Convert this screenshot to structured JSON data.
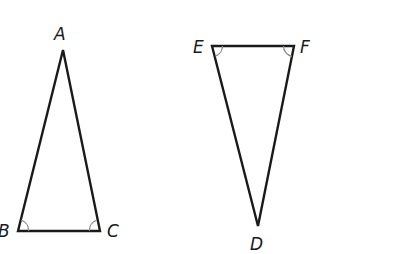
{
  "diagram": {
    "type": "geometry-congruent-triangles",
    "triangles": [
      {
        "name": "triangle-abc",
        "vertices": [
          {
            "label": "A",
            "x": 63,
            "y": 50,
            "label_x": 54,
            "label_y": 40
          },
          {
            "label": "B",
            "x": 18,
            "y": 231,
            "label_x": -2,
            "label_y": 237
          },
          {
            "label": "C",
            "x": 100,
            "y": 231,
            "label_x": 107,
            "label_y": 237
          }
        ],
        "marked_angles": [
          "B",
          "C"
        ]
      },
      {
        "name": "triangle-def",
        "vertices": [
          {
            "label": "E",
            "x": 212,
            "y": 46,
            "label_x": 193,
            "label_y": 53
          },
          {
            "label": "F",
            "x": 294,
            "y": 46,
            "label_x": 300,
            "label_y": 53
          },
          {
            "label": "D",
            "x": 258,
            "y": 226,
            "label_x": 250,
            "label_y": 250
          }
        ],
        "marked_angles": [
          "E",
          "F"
        ]
      }
    ],
    "colors": {
      "stroke": "#1a1a1a",
      "angle_mark": "#8a8a8a",
      "background": "#ffffff"
    }
  }
}
